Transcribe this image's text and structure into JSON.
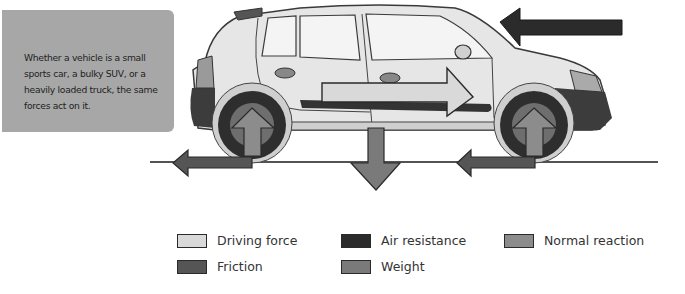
{
  "info_box": {
    "text": "Whether a vehicle is a small sports car, a bulky SUV, or a heavily loaded truck, the same forces act on it."
  },
  "colors": {
    "driving_force": "#d9d9d9",
    "air_resistance": "#2b2b2b",
    "normal_reaction": "#8c8c8c",
    "friction": "#555555",
    "weight": "#7a7a7a",
    "info_box_bg": "#a7a7a7"
  },
  "legend": {
    "items": [
      {
        "id": "driving_force",
        "label": "Driving force"
      },
      {
        "id": "air_resistance",
        "label": "Air resistance"
      },
      {
        "id": "normal_reaction",
        "label": "Normal reaction"
      },
      {
        "id": "friction",
        "label": "Friction"
      },
      {
        "id": "weight",
        "label": "Weight"
      }
    ]
  }
}
